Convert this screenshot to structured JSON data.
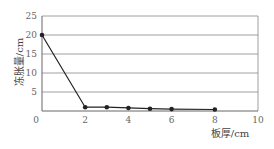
{
  "chart_data": {
    "type": "line",
    "title": "",
    "xlabel": "板厚/cm",
    "ylabel": "冻胀量/cm",
    "xlim": [
      0,
      10
    ],
    "ylim": [
      0,
      25
    ],
    "x_ticks": [
      0,
      2,
      4,
      6,
      8,
      10
    ],
    "y_ticks": [
      5,
      10,
      15,
      20,
      25
    ],
    "grid": {
      "horizontal": true,
      "vertical": false
    },
    "legend": null,
    "series": [
      {
        "name": "冻胀量",
        "x": [
          0,
          2,
          3,
          4,
          5,
          6,
          8
        ],
        "values": [
          20,
          1.0,
          1.0,
          0.8,
          0.6,
          0.5,
          0.4
        ],
        "color": "#222222",
        "marker": "circle"
      }
    ]
  },
  "colors": {
    "line": "#222222",
    "grid": "#888888",
    "text": "#666666"
  }
}
